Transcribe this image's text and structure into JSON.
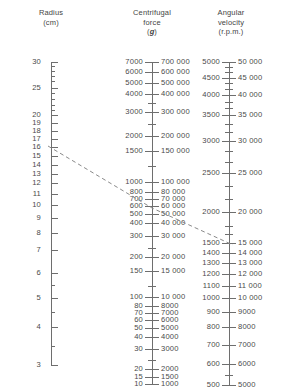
{
  "columns": {
    "radius": {
      "title_line1": "Radius",
      "title_line2": "(cm)",
      "title_line3": ""
    },
    "force": {
      "title_line1": "Centrifugal",
      "title_line2": "force",
      "title_line3": "g"
    },
    "angular": {
      "title_line1": "Angular",
      "title_line2": "velocity",
      "title_line3": "(r.p.m.)"
    }
  },
  "chart_data": {
    "type": "nomogram",
    "axes": [
      {
        "name": "radius",
        "label": "Radius (cm)",
        "unit": "cm",
        "scale": "log",
        "x_px": 51,
        "range": [
          3,
          30
        ],
        "ticks": [
          {
            "value": 30,
            "y": 62,
            "label": "30",
            "major": true
          },
          {
            "value": 29,
            "y": 66,
            "label": "",
            "major": false
          },
          {
            "value": 28,
            "y": 71,
            "label": "",
            "major": false
          },
          {
            "value": 27,
            "y": 76,
            "label": "",
            "major": false
          },
          {
            "value": 26,
            "y": 81,
            "label": "",
            "major": false
          },
          {
            "value": 25,
            "y": 88,
            "label": "25",
            "major": true
          },
          {
            "value": 24,
            "y": 93,
            "label": "",
            "major": false
          },
          {
            "value": 23,
            "y": 99,
            "label": "",
            "major": false
          },
          {
            "value": 22,
            "y": 105,
            "label": "",
            "major": false
          },
          {
            "value": 21,
            "y": 110,
            "label": "",
            "major": false
          },
          {
            "value": 20,
            "y": 115,
            "label": "20",
            "major": true
          },
          {
            "value": 19,
            "y": 123,
            "label": "19",
            "major": true
          },
          {
            "value": 18,
            "y": 131,
            "label": "18",
            "major": true
          },
          {
            "value": 17,
            "y": 139,
            "label": "17",
            "major": true
          },
          {
            "value": 16,
            "y": 147,
            "label": "16",
            "major": true
          },
          {
            "value": 15,
            "y": 156,
            "label": "15",
            "major": true
          },
          {
            "value": 14,
            "y": 165,
            "label": "14",
            "major": true
          },
          {
            "value": 13,
            "y": 174,
            "label": "13",
            "major": true
          },
          {
            "value": 12,
            "y": 183,
            "label": "12",
            "major": true
          },
          {
            "value": 11,
            "y": 194,
            "label": "11",
            "major": true
          },
          {
            "value": 10,
            "y": 205,
            "label": "10",
            "major": true
          },
          {
            "value": 9,
            "y": 218,
            "label": "9",
            "major": true
          },
          {
            "value": 8,
            "y": 233,
            "label": "8",
            "major": true
          },
          {
            "value": 7,
            "y": 250,
            "label": "7",
            "major": true
          },
          {
            "value": 6,
            "y": 273,
            "label": "6",
            "major": true
          },
          {
            "value": 5.5,
            "y": 285,
            "label": "",
            "major": false
          },
          {
            "value": 5,
            "y": 298,
            "label": "5",
            "major": true
          },
          {
            "value": 4.5,
            "y": 312,
            "label": "",
            "major": false
          },
          {
            "value": 4,
            "y": 327,
            "label": "4",
            "major": true
          },
          {
            "value": 3.5,
            "y": 346,
            "label": "",
            "major": false
          },
          {
            "value": 3,
            "y": 365,
            "label": "3",
            "major": true
          }
        ]
      },
      {
        "name": "force",
        "label": "Centrifugal force (g)",
        "unit": "g",
        "scale": "log",
        "x_px": 152,
        "range_left": [
          10,
          7000
        ],
        "range_right": [
          1000,
          700000
        ],
        "ticks": [
          {
            "left": "7000",
            "right": "700 000",
            "y": 62,
            "major": true
          },
          {
            "left": "6000",
            "right": "600 000",
            "y": 72,
            "major": true
          },
          {
            "left": "5000",
            "right": "500 000",
            "y": 83,
            "major": true
          },
          {
            "left": "4000",
            "right": "400 000",
            "y": 94,
            "major": true
          },
          {
            "left": "",
            "right": "",
            "y": 103,
            "major": false
          },
          {
            "left": "3000",
            "right": "300 000",
            "y": 112,
            "major": true
          },
          {
            "left": "",
            "right": "",
            "y": 124,
            "major": false
          },
          {
            "left": "2000",
            "right": "200 000",
            "y": 136,
            "major": true
          },
          {
            "left": "1500",
            "right": "150 000",
            "y": 151,
            "major": true
          },
          {
            "left": "",
            "right": "",
            "y": 166,
            "major": false
          },
          {
            "left": "1000",
            "right": "100 000",
            "y": 182,
            "major": true
          },
          {
            "left": "800",
            "right": "80 000",
            "y": 192,
            "major": true
          },
          {
            "left": "700",
            "right": "70 000",
            "y": 199,
            "major": true
          },
          {
            "left": "600",
            "right": "60 000",
            "y": 206,
            "major": true
          },
          {
            "left": "500",
            "right": "50 000",
            "y": 214,
            "major": true
          },
          {
            "left": "400",
            "right": "40 000",
            "y": 223,
            "major": true
          },
          {
            "left": "300",
            "right": "30 000",
            "y": 236,
            "major": true
          },
          {
            "left": "",
            "right": "",
            "y": 248,
            "major": false
          },
          {
            "left": "200",
            "right": "20 000",
            "y": 257,
            "major": true
          },
          {
            "left": "150",
            "right": "15 000",
            "y": 271,
            "major": true
          },
          {
            "left": "",
            "right": "",
            "y": 286,
            "major": false
          },
          {
            "left": "100",
            "right": "10 000",
            "y": 297,
            "major": true
          },
          {
            "left": "80",
            "right": "8000",
            "y": 306,
            "major": true
          },
          {
            "left": "70",
            "right": "7000",
            "y": 313,
            "major": true
          },
          {
            "left": "60",
            "right": "6000",
            "y": 320,
            "major": true
          },
          {
            "left": "50",
            "right": "5000",
            "y": 328,
            "major": true
          },
          {
            "left": "40",
            "right": "4000",
            "y": 337,
            "major": true
          },
          {
            "left": "30",
            "right": "3000",
            "y": 349,
            "major": true
          },
          {
            "left": "",
            "right": "",
            "y": 360,
            "major": false
          },
          {
            "left": "20",
            "right": "2000",
            "y": 369,
            "major": true
          },
          {
            "left": "15",
            "right": "1500",
            "y": 377,
            "major": true
          },
          {
            "left": "10",
            "right": "1000",
            "y": 384,
            "major": true
          }
        ]
      },
      {
        "name": "angular",
        "label": "Angular velocity (r.p.m.)",
        "unit": "r.p.m.",
        "scale": "log",
        "x_px": 229,
        "range_left": [
          500,
          5000
        ],
        "range_right": [
          5000,
          50000
        ],
        "ticks": [
          {
            "left": "5000",
            "right": "50 000",
            "y": 62,
            "major": true
          },
          {
            "left": "",
            "right": "",
            "y": 67,
            "major": false
          },
          {
            "left": "",
            "right": "",
            "y": 72,
            "major": false
          },
          {
            "left": "4500",
            "right": "45 000",
            "y": 78,
            "major": true
          },
          {
            "left": "",
            "right": "",
            "y": 83,
            "major": false
          },
          {
            "left": "",
            "right": "",
            "y": 89,
            "major": false
          },
          {
            "left": "4000",
            "right": "40 000",
            "y": 95,
            "major": true
          },
          {
            "left": "",
            "right": "",
            "y": 102,
            "major": false
          },
          {
            "left": "",
            "right": "",
            "y": 108,
            "major": false
          },
          {
            "left": "3500",
            "right": "35 000",
            "y": 115,
            "major": true
          },
          {
            "left": "",
            "right": "",
            "y": 124,
            "major": false
          },
          {
            "left": "",
            "right": "",
            "y": 132,
            "major": false
          },
          {
            "left": "3000",
            "right": "30 000",
            "y": 141,
            "major": true
          },
          {
            "left": "",
            "right": "",
            "y": 151,
            "major": false
          },
          {
            "left": "",
            "right": "",
            "y": 162,
            "major": false
          },
          {
            "left": "2500",
            "right": "25 000",
            "y": 173,
            "major": true
          },
          {
            "left": "",
            "right": "",
            "y": 186,
            "major": false
          },
          {
            "left": "",
            "right": "",
            "y": 199,
            "major": false
          },
          {
            "left": "2000",
            "right": "20 000",
            "y": 212,
            "major": true
          },
          {
            "left": "",
            "right": "",
            "y": 226,
            "major": false
          },
          {
            "left": "",
            "right": "",
            "y": 234,
            "major": false
          },
          {
            "left": "1500",
            "right": "15 000",
            "y": 243,
            "major": true
          },
          {
            "left": "1400",
            "right": "14 000",
            "y": 253,
            "major": true
          },
          {
            "left": "1300",
            "right": "13 000",
            "y": 263,
            "major": true
          },
          {
            "left": "1200",
            "right": "12 000",
            "y": 274,
            "major": true
          },
          {
            "left": "1100",
            "right": "11 000",
            "y": 286,
            "major": true
          },
          {
            "left": "1000",
            "right": "10 000",
            "y": 298,
            "major": true
          },
          {
            "left": "900",
            "right": "9000",
            "y": 312,
            "major": true
          },
          {
            "left": "800",
            "right": "8000",
            "y": 327,
            "major": true
          },
          {
            "left": "700",
            "right": "7000",
            "y": 345,
            "major": true
          },
          {
            "left": "600",
            "right": "6000",
            "y": 364,
            "major": true
          },
          {
            "left": "",
            "right": "",
            "y": 375,
            "major": false
          },
          {
            "left": "500",
            "right": "5000",
            "y": 385,
            "major": true
          }
        ]
      }
    ],
    "construction_line": {
      "style": "dashed",
      "color": "#8a8a8a",
      "from": {
        "axis": "radius",
        "value": 16,
        "x": 48,
        "y": 146
      },
      "via": {
        "axis": "force",
        "value": 300,
        "x": 152,
        "y": 208
      },
      "to": {
        "axis": "angular",
        "value": 1250,
        "x": 233,
        "y": 245
      }
    }
  }
}
